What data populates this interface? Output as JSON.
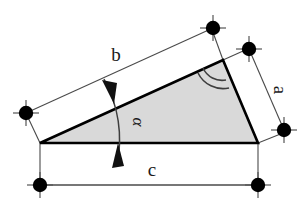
{
  "figure": {
    "type": "geometry-diagram",
    "background_color": "#ffffff",
    "outline_color": "#000000",
    "fill_color": "#d9d9d9",
    "dimension_line_color": "#3a3a3a"
  },
  "triangle": {
    "name": "shaded-triangle",
    "vertices": {
      "left": {
        "x": 40,
        "y": 143
      },
      "apex": {
        "x": 223,
        "y": 60
      },
      "right": {
        "x": 258,
        "y": 143
      }
    }
  },
  "labels": {
    "side_b": "b",
    "side_a": "a",
    "side_c": "c",
    "angle_alpha": "α"
  },
  "dimensions": [
    {
      "id": "dimension-b",
      "label": "b",
      "label_x": 116,
      "label_y": 61,
      "label_rotation": 0,
      "line": {
        "x1": 26,
        "y1": 113,
        "x2": 212,
        "y2": 28
      },
      "ext_from": {
        "x1": 40,
        "y1": 143,
        "x2": 26,
        "y2": 113
      },
      "ext_to": {
        "x1": 223,
        "y1": 60,
        "x2": 212,
        "y2": 28
      },
      "marker_start": {
        "x": 26,
        "y": 113
      },
      "marker_end": {
        "x": 212,
        "y": 28
      }
    },
    {
      "id": "dimension-a",
      "label": "a",
      "label_x": 276,
      "label_y": 88,
      "label_rotation": 90,
      "line": {
        "x1": 249,
        "y1": 49,
        "x2": 284,
        "y2": 130
      },
      "ext_from": {
        "x1": 223,
        "y1": 60,
        "x2": 249,
        "y2": 49
      },
      "ext_to": {
        "x1": 258,
        "y1": 143,
        "x2": 284,
        "y2": 130
      },
      "marker_start": {
        "x": 249,
        "y": 49
      },
      "marker_end": {
        "x": 284,
        "y": 130
      }
    },
    {
      "id": "dimension-c",
      "label": "c",
      "label_x": 152,
      "label_y": 174,
      "label_rotation": 0,
      "line": {
        "x1": 40,
        "y1": 185,
        "x2": 258,
        "y2": 185
      },
      "ext_from": {
        "x1": 40,
        "y1": 143,
        "x2": 40,
        "y2": 185
      },
      "ext_to": {
        "x1": 258,
        "y1": 143,
        "x2": 258,
        "y2": 185
      },
      "marker_start": {
        "x": 40,
        "y": 185
      },
      "marker_end": {
        "x": 258,
        "y": 185
      }
    }
  ],
  "angle_markers": [
    {
      "id": "angle-alpha-arc",
      "label": "α",
      "at_vertex": "left",
      "style": "arc-with-double-arrowheads",
      "label_x": 131,
      "label_y": 122,
      "label_rotation": 90
    },
    {
      "id": "angle-apex-double-arc",
      "label": "",
      "at_vertex": "apex",
      "style": "double-arc"
    }
  ],
  "markers": {
    "name": "dimension-endpoint-dot",
    "shape": "filled-circle-with-cross-ticks",
    "radius": 7,
    "count": 6
  }
}
